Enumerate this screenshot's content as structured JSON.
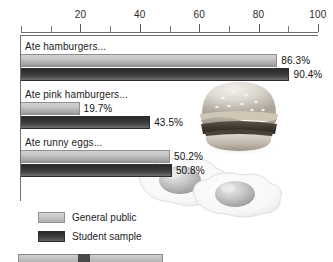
{
  "chart_data": {
    "type": "bar",
    "orientation": "horizontal",
    "title": "",
    "xlabel": "",
    "ylabel": "",
    "xlim": [
      0,
      100
    ],
    "xticks": [
      0,
      10,
      20,
      30,
      40,
      50,
      60,
      70,
      80,
      90,
      100
    ],
    "xtick_labels": [
      "20",
      "40",
      "60",
      "80",
      "100"
    ],
    "xtick_label_values": [
      20,
      40,
      60,
      80,
      100
    ],
    "grid": false,
    "legend_position": "bottom-left",
    "categories": [
      "Ate hamburgers...",
      "Ate pink hamburgers...",
      "Ate runny eggs..."
    ],
    "series": [
      {
        "name": "General public",
        "color": "#c6c6c6",
        "values": [
          86.3,
          19.7,
          50.2
        ],
        "labels": [
          "86.3%",
          "19.7%",
          "50.2%"
        ]
      },
      {
        "name": "Student sample",
        "color": "#3a3a3a",
        "values": [
          90.4,
          43.5,
          50.8
        ],
        "labels": [
          "90.4%",
          "43.5%",
          "50.8%"
        ]
      }
    ]
  },
  "axis": {
    "ticks": [
      {
        "value": 0,
        "label": "",
        "major": false
      },
      {
        "value": 10,
        "label": "",
        "major": false
      },
      {
        "value": 20,
        "label": "20",
        "major": true
      },
      {
        "value": 30,
        "label": "",
        "major": false
      },
      {
        "value": 40,
        "label": "40",
        "major": true
      },
      {
        "value": 50,
        "label": "",
        "major": false
      },
      {
        "value": 60,
        "label": "60",
        "major": true
      },
      {
        "value": 70,
        "label": "",
        "major": false
      },
      {
        "value": 80,
        "label": "80",
        "major": true
      },
      {
        "value": 90,
        "label": "",
        "major": false
      },
      {
        "value": 100,
        "label": "100",
        "major": true
      }
    ]
  },
  "legend": {
    "items": [
      {
        "label": "General public",
        "style": "light"
      },
      {
        "label": "Student sample",
        "style": "dark"
      }
    ]
  },
  "decorations": [
    {
      "name": "hamburger-photo",
      "alt": "hamburger"
    },
    {
      "name": "fried-eggs-photo",
      "alt": "two fried eggs"
    }
  ],
  "colors": {
    "bar_light": "#c6c6c6",
    "bar_dark": "#3a3a3a",
    "axis": "#6d6d6d",
    "text": "#1a1a1a",
    "background": "#ffffff"
  }
}
